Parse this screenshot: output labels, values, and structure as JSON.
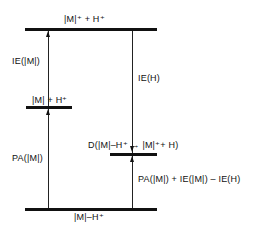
{
  "diagram": {
    "type": "energy-level-diagram",
    "levels": [
      {
        "id": "top",
        "label": "|M|⁺ +  H⁺"
      },
      {
        "id": "mid_left",
        "label": "|M| + H⁺"
      },
      {
        "id": "mid_right",
        "label": "D(|M|–H⁺ → |M|⁺+ H)"
      },
      {
        "id": "bottom",
        "label": "|M|–H⁺"
      }
    ],
    "transitions": [
      {
        "from": "mid_left",
        "to": "top",
        "label": "IE(|M|)",
        "direction": "up"
      },
      {
        "from": "bottom",
        "to": "mid_left",
        "label": "PA(|M|)",
        "direction": "up"
      },
      {
        "from": "top",
        "to": "mid_right",
        "label": "IE(H)",
        "direction": "down"
      },
      {
        "from": "bottom",
        "to": "mid_right",
        "label": "PA(|M|) + IE(|M|) – IE(H)",
        "direction": "up"
      }
    ]
  }
}
